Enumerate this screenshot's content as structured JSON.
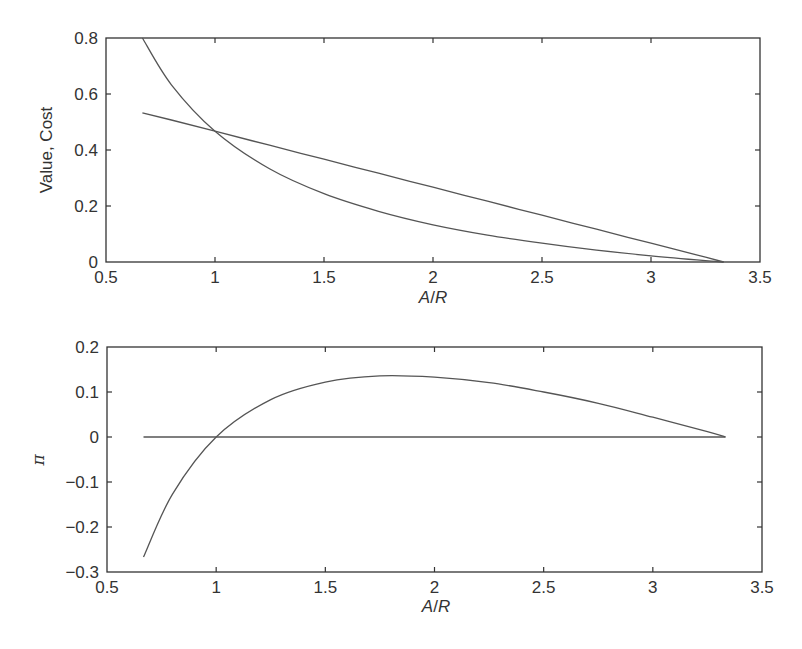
{
  "chart_data": [
    {
      "type": "line",
      "title": "",
      "xlabel": "A/R",
      "ylabel": "Value, Cost",
      "xlim": [
        0.5,
        3.5
      ],
      "ylim": [
        0,
        0.8
      ],
      "xticks": [
        "0.5",
        "1",
        "1.5",
        "2",
        "2.5",
        "3",
        "3.5"
      ],
      "yticks": [
        "0",
        "0.2",
        "0.4",
        "0.6",
        "0.8"
      ],
      "grid": false,
      "legend": null,
      "x": [
        0.667,
        0.8,
        1.0,
        1.25,
        1.5,
        1.75,
        2.0,
        2.25,
        2.5,
        2.75,
        3.0,
        3.25,
        3.333
      ],
      "series": [
        {
          "name": "Value",
          "values": [
            0.533,
            0.507,
            0.467,
            0.417,
            0.367,
            0.317,
            0.267,
            0.217,
            0.167,
            0.117,
            0.067,
            0.017,
            0.0
          ]
        },
        {
          "name": "Cost",
          "values": [
            0.8,
            0.633,
            0.467,
            0.333,
            0.244,
            0.181,
            0.133,
            0.096,
            0.067,
            0.042,
            0.022,
            0.005,
            0.0
          ]
        }
      ]
    },
    {
      "type": "line",
      "title": "",
      "xlabel": "A/R",
      "ylabel": "π",
      "xlim": [
        0.5,
        3.5
      ],
      "ylim": [
        -0.3,
        0.2
      ],
      "xticks": [
        "0.5",
        "1",
        "1.5",
        "2",
        "2.5",
        "3",
        "3.5"
      ],
      "yticks": [
        "-0.3",
        "-0.2",
        "-0.1",
        "0",
        "0.1",
        "0.2"
      ],
      "grid": false,
      "legend": null,
      "x": [
        0.667,
        0.8,
        1.0,
        1.25,
        1.5,
        1.75,
        2.0,
        2.25,
        2.5,
        2.75,
        3.0,
        3.25,
        3.333
      ],
      "series": [
        {
          "name": "Profit π",
          "values": [
            -0.267,
            -0.127,
            0.0,
            0.083,
            0.122,
            0.136,
            0.133,
            0.121,
            0.1,
            0.075,
            0.044,
            0.012,
            0.0
          ]
        },
        {
          "name": "Zero line",
          "values": [
            0,
            0,
            0,
            0,
            0,
            0,
            0,
            0,
            0,
            0,
            0,
            0,
            0
          ]
        }
      ]
    }
  ],
  "plots": {
    "top": {
      "ylabel": "Value, Cost",
      "xlabel_a": "A",
      "xlabel_sep": "/",
      "xlabel_b": "R",
      "xticks": [
        "0.5",
        "1",
        "1.5",
        "2",
        "2.5",
        "3",
        "3.5"
      ],
      "yticks": [
        "0",
        "0.2",
        "0.4",
        "0.6",
        "0.8"
      ]
    },
    "bottom": {
      "ylabel": "π",
      "xlabel_a": "A",
      "xlabel_sep": "/",
      "xlabel_b": "R",
      "xticks": [
        "0.5",
        "1",
        "1.5",
        "2",
        "2.5",
        "3",
        "3.5"
      ],
      "yticks": [
        "−0.3",
        "−0.2",
        "−0.1",
        "0",
        "0.1",
        "0.2"
      ]
    }
  },
  "colors": {
    "axes": "#333333",
    "lines": "#555555"
  }
}
